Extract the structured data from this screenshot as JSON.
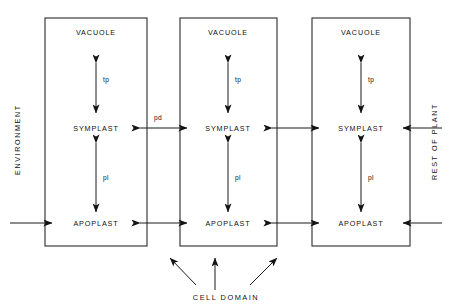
{
  "figure": {
    "title_hidden": "",
    "background_color": "#ffffff",
    "line_color": "#2b2b2b",
    "text_color": "#111111"
  },
  "left_boundary_label": "ENVIRONMENT",
  "right_boundary_label": "REST OF PLANT",
  "bottom_label": "CELL DOMAIN",
  "compartments": {
    "vacuole": "VACUOLE",
    "symplast": "SYMPLAST",
    "apoplast": "APOPLAST"
  },
  "membranes": {
    "tonoplast": "tp",
    "plasmalemma": "pl",
    "plasmodesmata": "pd"
  },
  "cells": [
    {
      "id": "cell-1",
      "vacuole": "VACUOLE",
      "symplast": "SYMPLAST",
      "apoplast": "APOPLAST",
      "vacuole_symplast_flux": "tp",
      "symplast_apoplast_flux": "pl"
    },
    {
      "id": "cell-2",
      "vacuole": "VACUOLE",
      "symplast": "SYMPLAST",
      "apoplast": "APOPLAST",
      "vacuole_symplast_flux": "tp",
      "symplast_apoplast_flux": "pl"
    },
    {
      "id": "cell-3",
      "vacuole": "VACUOLE",
      "symplast": "SYMPLAST",
      "apoplast": "APOPLAST",
      "vacuole_symplast_flux": "tp",
      "symplast_apoplast_flux": "pl"
    }
  ],
  "inter_cell_connections": [
    {
      "from": "cell-1",
      "to": "cell-2",
      "level": "symplast",
      "label": "pd"
    },
    {
      "from": "cell-2",
      "to": "cell-3",
      "level": "symplast",
      "label": ""
    },
    {
      "from": "cell-1",
      "to": "cell-2",
      "level": "apoplast",
      "label": ""
    },
    {
      "from": "cell-2",
      "to": "cell-3",
      "level": "apoplast",
      "label": ""
    }
  ]
}
